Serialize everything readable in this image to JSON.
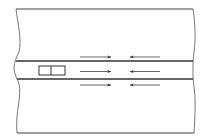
{
  "diagram": {
    "type": "road-schematic",
    "elements": {
      "vehicle": {
        "segments": 2
      },
      "arrows": [
        {
          "row": "above",
          "direction": "right"
        },
        {
          "row": "above",
          "direction": "left"
        },
        {
          "row": "middle",
          "direction": "right"
        },
        {
          "row": "middle",
          "direction": "left"
        },
        {
          "row": "below",
          "direction": "right"
        },
        {
          "row": "below",
          "direction": "left"
        }
      ]
    },
    "colors": {
      "stroke": "#444444",
      "arrow": "#555555",
      "background": "#ffffff"
    }
  }
}
